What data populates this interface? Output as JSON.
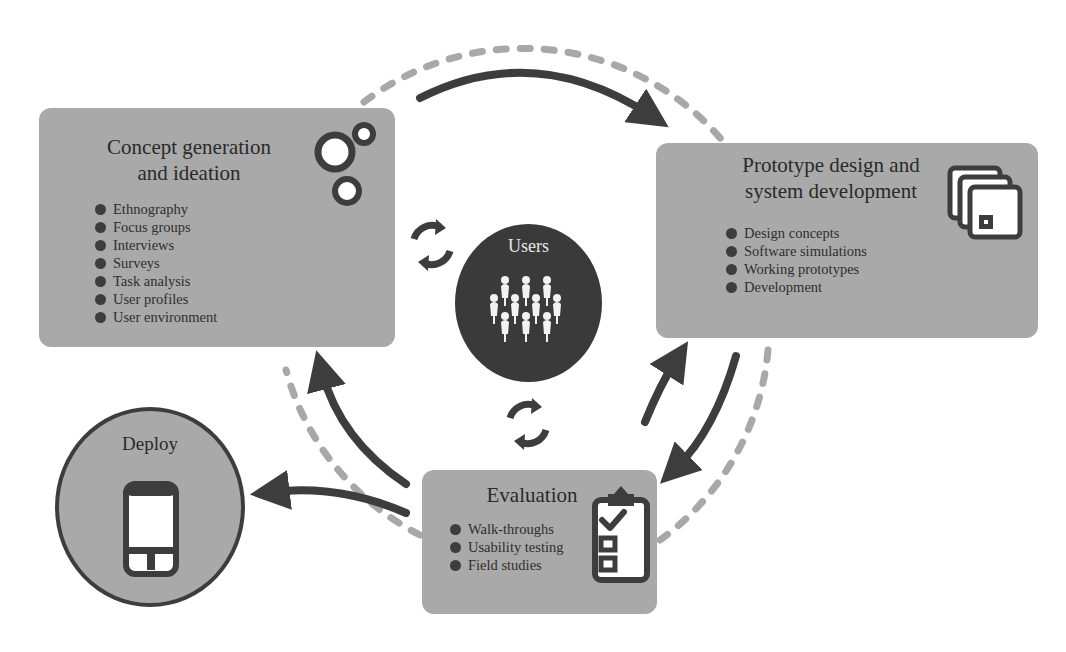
{
  "diagram": {
    "colors": {
      "box_fill": "#a9a9a9",
      "dark": "#3d3d3d",
      "dashed_ring": "#a8a8a8",
      "users_fill": "#3a3a3a",
      "background": "#ffffff"
    },
    "center": {
      "label": "Users",
      "icon": "people-group-icon"
    },
    "stages": {
      "concept": {
        "title": "Concept generation\nand ideation",
        "icon": "connected-circles-icon",
        "items": [
          "Ethnography",
          "Focus groups",
          "Interviews",
          "Surveys",
          "Task analysis",
          "User profiles",
          "User environment"
        ]
      },
      "prototype": {
        "title": "Prototype design and\nsystem development",
        "icon": "stacked-windows-icon",
        "items": [
          "Design concepts",
          "Software simulations",
          "Working prototypes",
          "Development"
        ]
      },
      "evaluation": {
        "title": "Evaluation",
        "icon": "clipboard-checklist-icon",
        "items": [
          "Walk-throughs",
          "Usability testing",
          "Field studies"
        ]
      },
      "deploy": {
        "title": "Deploy",
        "icon": "smartphone-icon"
      }
    },
    "connectors": [
      {
        "from": "concept",
        "to": "prototype",
        "type": "arrow"
      },
      {
        "from": "prototype",
        "to": "evaluation",
        "type": "arrow"
      },
      {
        "from": "evaluation",
        "to": "prototype",
        "type": "arrow"
      },
      {
        "from": "evaluation",
        "to": "concept",
        "type": "arrow"
      },
      {
        "from": "evaluation",
        "to": "deploy",
        "type": "arrow"
      },
      {
        "between": "concept-users",
        "type": "cycle"
      },
      {
        "between": "users-evaluation",
        "type": "cycle"
      }
    ]
  }
}
